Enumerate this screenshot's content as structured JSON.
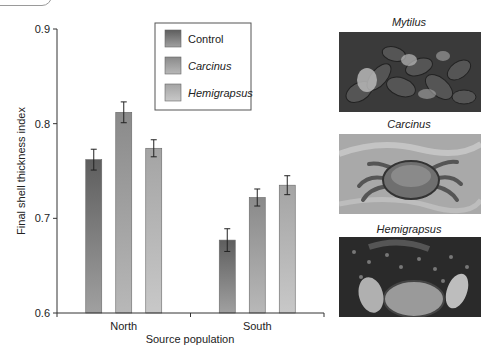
{
  "chart_data": {
    "type": "bar",
    "title": "",
    "xlabel": "Source population",
    "ylabel": "Final shell thickness index",
    "ylim": [
      0.6,
      0.9
    ],
    "yticks": [
      "0.6",
      "0.7",
      "0.8",
      "0.9"
    ],
    "ytick_values": [
      0.6,
      0.7,
      0.8,
      0.9
    ],
    "categories": [
      "North",
      "South"
    ],
    "series": [
      {
        "name": "Control",
        "italic": false,
        "values": [
          0.762,
          0.677
        ],
        "errors": [
          0.011,
          0.012
        ],
        "color_top": "#5e5e5e",
        "color_bottom": "#a0a0a0"
      },
      {
        "name": "Carcinus",
        "italic": true,
        "values": [
          0.812,
          0.722
        ],
        "errors": [
          0.011,
          0.009
        ],
        "color_top": "#8a8a8a",
        "color_bottom": "#b8b8b8"
      },
      {
        "name": "Hemigrapsus",
        "italic": true,
        "values": [
          0.774,
          0.735
        ],
        "errors": [
          0.009,
          0.01
        ],
        "color_top": "#a4a4a4",
        "color_bottom": "#c8c8c8"
      }
    ],
    "legend": {
      "placement": "top-center",
      "boxed": true
    },
    "grid": false
  },
  "photos": [
    {
      "title": "Mytilus",
      "subject": "mussel-cluster"
    },
    {
      "title": "Carcinus",
      "subject": "green-crab"
    },
    {
      "title": "Hemigrapsus",
      "subject": "asian-shore-crab"
    }
  ]
}
